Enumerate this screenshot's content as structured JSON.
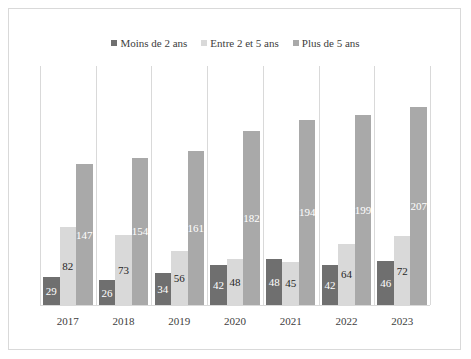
{
  "chart_data": {
    "type": "bar",
    "title": "",
    "xlabel": "",
    "ylabel": "",
    "ylim": [
      0,
      250
    ],
    "grid": "vertical category separators",
    "legend_position": "top",
    "categories": [
      "2017",
      "2018",
      "2019",
      "2020",
      "2021",
      "2022",
      "2023"
    ],
    "series": [
      {
        "name": "Moins de 2 ans",
        "color": "#6f6f6f",
        "label_color": "#ffffff",
        "values": [
          29,
          26,
          34,
          42,
          48,
          42,
          46
        ]
      },
      {
        "name": "Entre 2 et 5 ans",
        "color": "#d9d9d9",
        "label_color": "#262626",
        "values": [
          82,
          73,
          56,
          48,
          45,
          64,
          72
        ]
      },
      {
        "name": "Plus de 5 ans",
        "color": "#a9a9a9",
        "label_color": "#ffffff",
        "values": [
          147,
          154,
          161,
          182,
          194,
          199,
          207
        ]
      }
    ]
  }
}
